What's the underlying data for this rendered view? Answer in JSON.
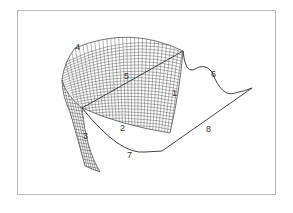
{
  "figure": {
    "type": "3d-surface-mesh-diagram",
    "frame_color": "#b8b8b8",
    "line_color": "#444444",
    "mesh_color": "#666666"
  },
  "labels": [
    {
      "id": "1",
      "text": "1",
      "x": 172,
      "y": 96
    },
    {
      "id": "2",
      "text": "2",
      "x": 120,
      "y": 131
    },
    {
      "id": "3",
      "text": "3",
      "x": 83,
      "y": 139
    },
    {
      "id": "4",
      "text": "4",
      "x": 75,
      "y": 50
    },
    {
      "id": "5",
      "text": "5",
      "x": 124,
      "y": 79
    },
    {
      "id": "6",
      "text": "6",
      "x": 211,
      "y": 77
    },
    {
      "id": "7",
      "text": "7",
      "x": 127,
      "y": 158
    },
    {
      "id": "8",
      "text": "8",
      "x": 206,
      "y": 132
    }
  ]
}
